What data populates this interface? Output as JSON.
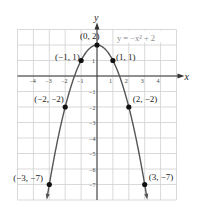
{
  "chart_data": {
    "type": "line",
    "title": "",
    "equation_label": "y = −x² + 2",
    "xlabel": "x",
    "ylabel": "y",
    "xlim": [
      -5,
      5
    ],
    "ylim": [
      -8,
      3
    ],
    "grid": true,
    "x_ticks": [
      -4,
      -3,
      -2,
      -1,
      1,
      2,
      3,
      4
    ],
    "y_ticks": [
      1,
      -1,
      -2,
      -3,
      -4,
      -5,
      -6,
      -7
    ],
    "series": [
      {
        "name": "y = -x^2 + 2",
        "function": "-x^2 + 2",
        "points": [
          {
            "x": -3,
            "y": -7,
            "label": "(−3, −7)"
          },
          {
            "x": -2,
            "y": -2,
            "label": "(−2, −2)"
          },
          {
            "x": -1,
            "y": 1,
            "label": "(−1, 1)"
          },
          {
            "x": 0,
            "y": 2,
            "label": "(0, 2)"
          },
          {
            "x": 1,
            "y": 1,
            "label": "(1, 1)"
          },
          {
            "x": 2,
            "y": -2,
            "label": "(2, −2)"
          },
          {
            "x": 3,
            "y": -7,
            "label": "(3, −7)"
          }
        ]
      }
    ],
    "colors": {
      "grid": "#cfcfcf",
      "axis": "#333333",
      "curve": "#555555",
      "point": "#111111",
      "equation": "#8a8a8a"
    }
  }
}
